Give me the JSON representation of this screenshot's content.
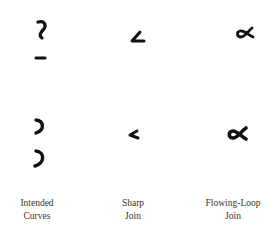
{
  "figure": {
    "columns": [
      {
        "id": "intended-curves",
        "label_line1": "Intended",
        "label_line2": "Curves"
      },
      {
        "id": "sharp-join",
        "label_line1": "Sharp",
        "label_line2": "Join"
      },
      {
        "id": "flowing-loop-join",
        "label_line1": "Flowing-Loop",
        "label_line2": "Join"
      }
    ],
    "rows": [
      {
        "id": "handwritten-input",
        "glyphs": [
          "curve-and-dash",
          "sharp-angle",
          "alpha-loop"
        ]
      },
      {
        "id": "rendered-output",
        "glyphs": [
          "two-curves",
          "sharp-angle-small",
          "alpha-loop-bold"
        ]
      }
    ],
    "ink_color": "#111111"
  }
}
